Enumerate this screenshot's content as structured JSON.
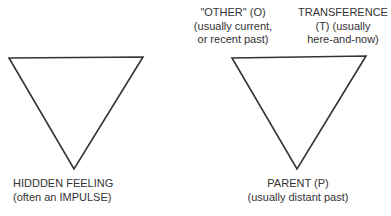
{
  "diagram": {
    "stroke_color": "#333333",
    "background": "#ffffff",
    "triangles": [
      {
        "id": "left",
        "orientation": "inverted",
        "points": [
          [
            9,
            58
          ],
          [
            143,
            57
          ],
          [
            74,
            169
          ]
        ]
      },
      {
        "id": "right",
        "orientation": "inverted",
        "points": [
          [
            232,
            58
          ],
          [
            366,
            56
          ],
          [
            297,
            169
          ]
        ]
      }
    ],
    "labels": {
      "hidden_feeling": {
        "line1": "HIDDDEN FEELING",
        "line2": "(often an IMPULSE)"
      },
      "other": {
        "line1": "\"OTHER\" (O)",
        "line2": "(usually current,",
        "line3": "or recent past)"
      },
      "transference": {
        "line1": "TRANSFERENCE",
        "line2": "(T) (usually",
        "line3": "here-and-now)"
      },
      "parent": {
        "line1": "PARENT (P)",
        "line2": "(usually distant past)"
      }
    }
  }
}
